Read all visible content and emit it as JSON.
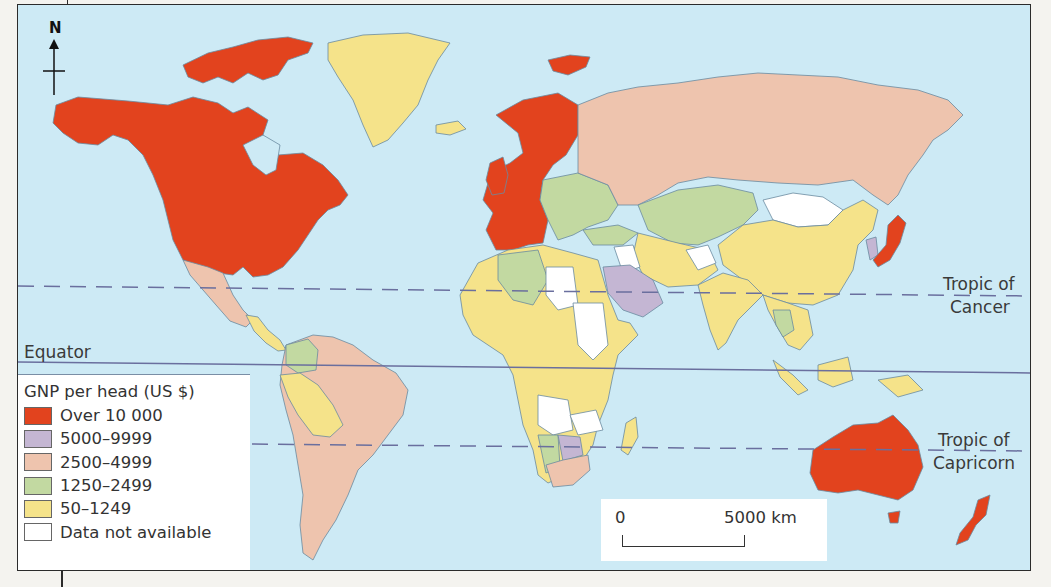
{
  "map": {
    "north_label": "N",
    "equator_label": "Equator",
    "tropic_cancer_label_1": "Tropic of",
    "tropic_cancer_label_2": "Cancer",
    "tropic_capricorn_label_1": "Tropic of",
    "tropic_capricorn_label_2": "Capricorn",
    "ocean_color": "#cdeaf5"
  },
  "legend": {
    "title": "GNP per head (US $)",
    "items": [
      {
        "label": "Over 10 000",
        "color": "#e2431e"
      },
      {
        "label": "5000–9999",
        "color": "#c4b6d3"
      },
      {
        "label": "2500–4999",
        "color": "#eec4ae"
      },
      {
        "label": "1250–2499",
        "color": "#c2d9a1"
      },
      {
        "label": "50–1249",
        "color": "#f5e38a"
      },
      {
        "label": "Data not available",
        "color": "#ffffff"
      }
    ]
  },
  "scale_bar": {
    "start_label": "0",
    "end_label": "5000 km"
  },
  "regions": [
    {
      "name": "Canada & USA",
      "category": "Over 10 000"
    },
    {
      "name": "Greenland",
      "category": "50–1249"
    },
    {
      "name": "Mexico",
      "category": "2500–4999"
    },
    {
      "name": "Central America",
      "category": "50–1249"
    },
    {
      "name": "Brazil & Argentina",
      "category": "2500–4999"
    },
    {
      "name": "Colombia",
      "category": "1250–2499"
    },
    {
      "name": "Peru & Bolivia",
      "category": "50–1249"
    },
    {
      "name": "Western Europe & Scandinavia",
      "category": "Over 10 000"
    },
    {
      "name": "Eastern Europe",
      "category": "1250–2499"
    },
    {
      "name": "Russia",
      "category": "2500–4999"
    },
    {
      "name": "Kazakhstan & Central Asia",
      "category": "1250–2499"
    },
    {
      "name": "Mongolia",
      "category": "Data not available"
    },
    {
      "name": "China",
      "category": "50–1249"
    },
    {
      "name": "India",
      "category": "50–1249"
    },
    {
      "name": "Japan",
      "category": "Over 10 000"
    },
    {
      "name": "South Korea",
      "category": "5000–9999"
    },
    {
      "name": "Saudi Arabia",
      "category": "5000–9999"
    },
    {
      "name": "Libya",
      "category": "Data not available"
    },
    {
      "name": "Sudan",
      "category": "Data not available"
    },
    {
      "name": "Algeria",
      "category": "1250–2499"
    },
    {
      "name": "Sub-Saharan Africa",
      "category": "50–1249"
    },
    {
      "name": "Angola",
      "category": "Data not available"
    },
    {
      "name": "Namibia",
      "category": "1250–2499"
    },
    {
      "name": "Botswana",
      "category": "5000–9999"
    },
    {
      "name": "South Africa",
      "category": "2500–4999"
    },
    {
      "name": "Madagascar",
      "category": "50–1249"
    },
    {
      "name": "Indonesia",
      "category": "50–1249"
    },
    {
      "name": "Thailand",
      "category": "1250–2499"
    },
    {
      "name": "Australia",
      "category": "Over 10 000"
    },
    {
      "name": "New Zealand",
      "category": "Over 10 000"
    }
  ]
}
